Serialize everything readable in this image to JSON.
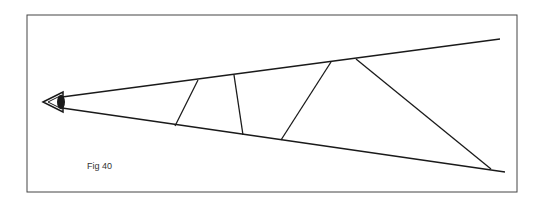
{
  "figure": {
    "caption": "Fig 40",
    "line_color": "#1a1a1a",
    "frame_color": "#444444",
    "background": "#ffffff"
  },
  "frame": {
    "x": 27,
    "y": 15,
    "width": 490,
    "height": 177
  },
  "eye": {
    "x": 43,
    "y": 102
  },
  "rays": [
    {
      "name": "upper-ray",
      "x1": 62,
      "y1": 97,
      "x2": 500,
      "y2": 39
    },
    {
      "name": "lower-ray",
      "x1": 62,
      "y1": 108,
      "x2": 505,
      "y2": 172
    }
  ],
  "cross_lines": [
    {
      "x1": 198,
      "y1": 80,
      "x2": 175,
      "y2": 126
    },
    {
      "x1": 234,
      "y1": 75,
      "x2": 243,
      "y2": 135
    },
    {
      "x1": 331,
      "y1": 62,
      "x2": 281,
      "y2": 140
    },
    {
      "x1": 356,
      "y1": 59,
      "x2": 491,
      "y2": 169
    }
  ]
}
